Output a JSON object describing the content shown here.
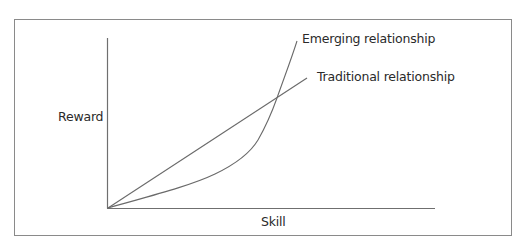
{
  "diagram": {
    "type": "line-concept-diagram",
    "axes": {
      "x_label": "Skill",
      "y_label": "Reward"
    },
    "series": [
      {
        "name": "Traditional relationship",
        "shape": "linear",
        "description": "straight line rising from origin"
      },
      {
        "name": "Emerging relationship",
        "shape": "convex-exponential",
        "description": "curve starting below traditional line, rising steeply and crossing it"
      }
    ],
    "colors": {
      "frame": "#8a8a8a",
      "axes": "#6f6f6f",
      "lines": "#6a6a6a",
      "text": "#2a2a2a"
    }
  },
  "labels": {
    "reward": "Reward",
    "skill": "Skill",
    "emerging": "Emerging relationship",
    "traditional": "Traditional relationship"
  }
}
